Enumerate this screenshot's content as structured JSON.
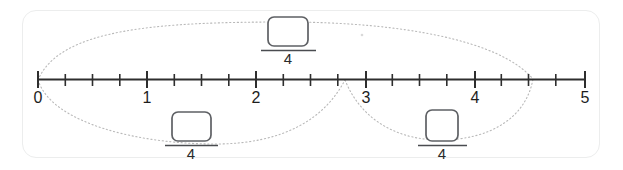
{
  "card": {
    "border_color": "#eceded",
    "background": "#ffffff"
  },
  "number_line": {
    "axis_color": "#2e2e2e",
    "min": 0,
    "max": 5,
    "subdivisions_per_unit": 4,
    "major_labels": [
      "0",
      "1",
      "2",
      "3",
      "4",
      "5"
    ],
    "major_values": [
      0,
      1,
      2,
      3,
      4,
      5
    ],
    "label_0": "0",
    "label_1": "1",
    "label_2": "2",
    "label_3": "3",
    "label_4": "4",
    "label_5": "5"
  },
  "fractions": [
    {
      "id": "top-fraction",
      "position": "above-line",
      "numerator": "",
      "numerator_placeholder": "",
      "denominator": "4",
      "box_empty": true
    },
    {
      "id": "bottom-left-fraction",
      "position": "below-line",
      "numerator": "",
      "numerator_placeholder": "",
      "denominator": "4",
      "box_empty": true
    },
    {
      "id": "bottom-right-fraction",
      "position": "below-line",
      "numerator": "",
      "numerator_placeholder": "",
      "denominator": "4",
      "box_empty": true
    }
  ],
  "arcs": [
    {
      "id": "arc-top",
      "from": 0,
      "to": 4.5,
      "direction": "above",
      "style": "dotted"
    },
    {
      "id": "arc-bottom-left",
      "from": 0,
      "to": 2.75,
      "direction": "below",
      "style": "dotted"
    },
    {
      "id": "arc-bottom-right",
      "from": 2.75,
      "to": 4.5,
      "direction": "below",
      "style": "dotted"
    }
  ],
  "colors": {
    "line": "#2e2e2e",
    "arc": "#b9b9b9",
    "box_stroke": "#5e6064",
    "text": "#1d1d1d",
    "card_border": "#eceded"
  }
}
